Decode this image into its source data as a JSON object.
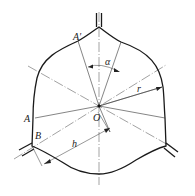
{
  "diagram": {
    "type": "technical-drawing",
    "labels": {
      "A_prime": "A′",
      "A": "A",
      "B": "B",
      "O": "O",
      "alpha": "α",
      "r": "r",
      "h": "h"
    },
    "colors": {
      "line": "#1a1a1a",
      "background": "#ffffff"
    }
  }
}
